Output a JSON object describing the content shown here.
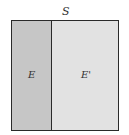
{
  "diagram": {
    "type": "venn-partition",
    "sample_space_label": "S",
    "regions": [
      {
        "id": "event",
        "label": "E",
        "fill": "#c6c6c6"
      },
      {
        "id": "complement",
        "label": "E'",
        "fill": "#e2e2e2"
      }
    ],
    "border_color": "#2a2a2a"
  }
}
